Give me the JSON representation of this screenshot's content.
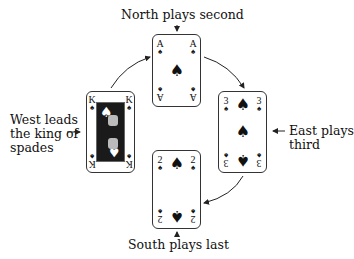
{
  "labels": {
    "north": "North plays second",
    "south": "South plays last",
    "west_line1": "West leads",
    "west_line2": "the king of",
    "west_line3": "spades",
    "east_line1": "East plays",
    "east_line2": "third"
  },
  "cards": {
    "north": {
      "rank": "A",
      "suit": "♠",
      "position": "North",
      "order": 2
    },
    "west": {
      "rank": "K",
      "suit": "♠",
      "position": "West",
      "order": 1
    },
    "east": {
      "rank": "3",
      "suit": "♠",
      "position": "East",
      "order": 3
    },
    "south": {
      "rank": "2",
      "suit": "♠",
      "position": "South",
      "order": 4
    }
  },
  "icons": {
    "small_arrow_down": "↓",
    "small_arrow_up": "↑",
    "arrow_right": "→",
    "arrow_left": "←"
  }
}
